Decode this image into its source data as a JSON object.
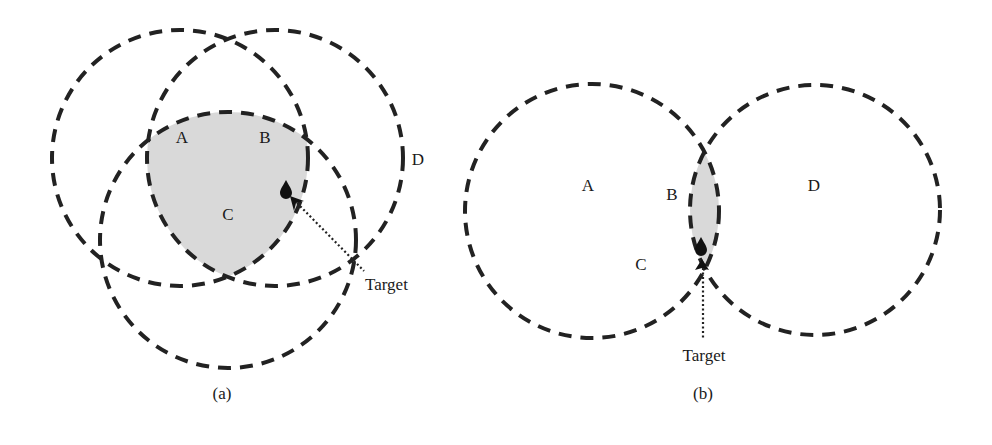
{
  "figure": {
    "colors": {
      "stroke": "#222222",
      "shade": "#d9d9d9",
      "background": "#ffffff",
      "text": "#1a1a1a"
    },
    "panel_a": {
      "caption": "(a)",
      "circle_labels": [
        "A",
        "B",
        "C",
        "D"
      ],
      "target_label": "Target",
      "shaded_region": "intersection of circles"
    },
    "panel_b": {
      "caption": "(b)",
      "circle_labels": [
        "A",
        "B",
        "C",
        "D"
      ],
      "target_label": "Target",
      "shaded_region": "lens-shaped intersection"
    }
  }
}
